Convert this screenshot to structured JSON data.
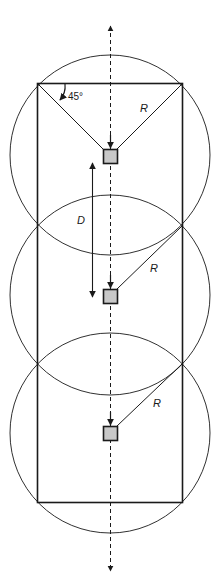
{
  "diagram": {
    "type": "coverage-layout",
    "colors": {
      "stroke": "#1a1a1a",
      "device_fill": "#c8c8c8",
      "background": "#ffffff"
    },
    "rectangle": {
      "x": 37,
      "y": 83,
      "width": 146,
      "height": 420
    },
    "axis": {
      "x": 110,
      "top_arrow_y": 24,
      "bottom_arrow_y": 573,
      "style": "dashed",
      "arrows": "both-ends"
    },
    "circles": [
      {
        "id": "top",
        "cx": 110,
        "cy": 155,
        "r": 100
      },
      {
        "id": "middle",
        "cx": 110,
        "cy": 295,
        "r": 100
      },
      {
        "id": "bottom",
        "cx": 110,
        "cy": 433,
        "r": 100
      }
    ],
    "devices": [
      {
        "id": "top",
        "cx": 110,
        "cy": 156,
        "size": 14
      },
      {
        "id": "middle",
        "cx": 110,
        "cy": 296,
        "size": 14
      },
      {
        "id": "bottom",
        "cx": 110,
        "cy": 433,
        "size": 14
      }
    ],
    "labels": {
      "angle": "45°",
      "radius": "R",
      "spacing": "D"
    },
    "radius_labels": [
      {
        "text": "R",
        "x": 140,
        "y": 112
      },
      {
        "text": "R",
        "x": 150,
        "y": 272
      },
      {
        "text": "R",
        "x": 153,
        "y": 407
      }
    ],
    "spacing_label": {
      "text": "D",
      "x": 77,
      "y": 224
    },
    "angle_label": {
      "text": "45°",
      "x": 68,
      "y": 100
    }
  }
}
